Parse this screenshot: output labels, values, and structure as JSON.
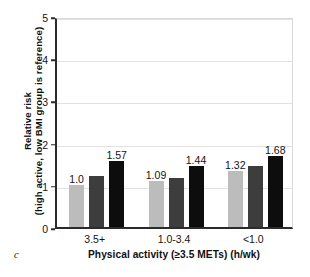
{
  "panel": {
    "letter": "c"
  },
  "chart_data": {
    "type": "bar",
    "title": "",
    "subtitle": "",
    "xlabel": "Physical activity (≥3.5 METs) (h/wk)",
    "ylabel_line1": "Relative risk",
    "ylabel_line2": "(high active, low BMI group is reference)",
    "categories": [
      "3.5+",
      "1.0-3.4",
      "<1.0"
    ],
    "yticks": [
      0,
      1,
      2,
      3,
      4,
      5
    ],
    "ylim": [
      0,
      5
    ],
    "grid": true,
    "legend": "none",
    "series": [
      {
        "name": "low BMI",
        "color": "#bcbcbc",
        "values": [
          1.0,
          1.09,
          1.32
        ],
        "labels": [
          "1.0",
          "1.09",
          "1.32"
        ]
      },
      {
        "name": "mid BMI",
        "color": "#3d3d3d",
        "values": [
          1.2,
          1.16,
          1.45
        ],
        "labels": [
          "",
          "",
          ""
        ]
      },
      {
        "name": "high BMI",
        "color": "#0d0d0d",
        "values": [
          1.57,
          1.44,
          1.68
        ],
        "labels": [
          "1.57",
          "1.44",
          "1.68"
        ]
      }
    ]
  }
}
